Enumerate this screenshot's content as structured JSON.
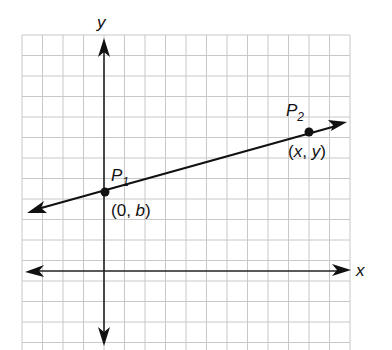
{
  "diagram": {
    "type": "coordinate-plane-line",
    "axes": {
      "x_label": "x",
      "y_label": "y"
    },
    "line": {
      "description": "line with positive slope through P1 and P2"
    },
    "points": [
      {
        "name": "P",
        "subscript": "1",
        "coord_open": "(",
        "coord_a": "0",
        "coord_sep": ", ",
        "coord_b": "b",
        "coord_close": ")"
      },
      {
        "name": "P",
        "subscript": "2",
        "coord_open": "(",
        "coord_a": "x",
        "coord_sep": ", ",
        "coord_b": "y",
        "coord_close": ")"
      }
    ],
    "colors": {
      "grid": "#c8c8c8",
      "ink": "#111111",
      "background": "#ffffff"
    }
  }
}
